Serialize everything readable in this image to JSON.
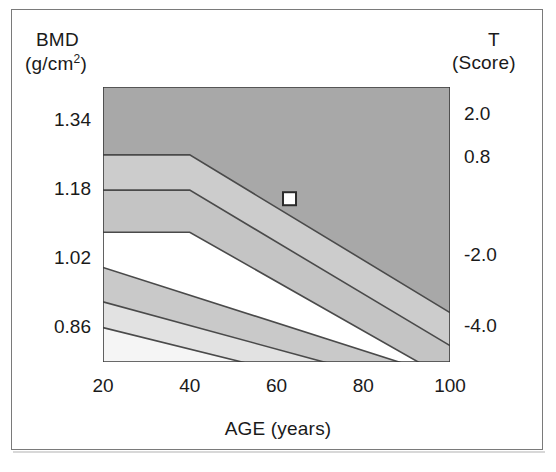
{
  "figure": {
    "type": "medical-chart",
    "background_color": "#ffffff",
    "frame_color": "#7a7a7a"
  },
  "axes": {
    "left_title_line1": "BMD",
    "left_title_line2_prefix": "(g/cm",
    "left_title_line2_sup": "2",
    "left_title_line2_suffix": ")",
    "right_title_line1": "T",
    "right_title_line2": "(Score)",
    "x_title": "AGE (years)"
  },
  "chart_data": {
    "type": "area",
    "title": "",
    "subtitle": "",
    "xlabel": "AGE (years)",
    "ylabel": "BMD (g/cm2)",
    "y2label": "T (Score)",
    "xlim": [
      20,
      100
    ],
    "ylim": [
      0.78,
      1.42
    ],
    "y2lim": [
      -5.0,
      2.8
    ],
    "grid": false,
    "legend": false,
    "x_ticks_major": [
      20,
      40,
      60,
      80,
      100
    ],
    "x_ticks_major_labels": [
      "20",
      "40",
      "60",
      "80",
      "100"
    ],
    "x_ticks_minor": [
      30,
      50,
      70,
      90
    ],
    "y_ticks_major": [
      1.34,
      1.18,
      1.02,
      0.86
    ],
    "y_ticks_major_labels": [
      "1.34",
      "1.18",
      "1.02",
      "0.86"
    ],
    "y_ticks_minor": [
      1.26,
      1.1,
      0.94
    ],
    "y2_ticks_major": [
      2.0,
      0.8,
      -2.0,
      -4.0
    ],
    "y2_ticks_major_labels": [
      "2.0",
      "0.8",
      "-2.0",
      "-4.0"
    ],
    "y2_ticks_minor": [
      1.4,
      -0.4,
      -1.0,
      -3.0
    ],
    "bands": [
      {
        "name": "normal-zone",
        "fill": "#a8a8a8",
        "description": "Upper dark gray region: normal bone mineral density",
        "upper_x": [
          20,
          100
        ],
        "upper_y": [
          1.42,
          1.42
        ],
        "lower_x": [
          20,
          40,
          100
        ],
        "lower_y": [
          1.262,
          1.262,
          0.895
        ]
      },
      {
        "name": "mean-upper-band",
        "fill": "#cccccc",
        "description": "Band between +1SD line and mean line",
        "upper_x": [
          20,
          40,
          100
        ],
        "upper_y": [
          1.262,
          1.262,
          0.895
        ],
        "lower_x": [
          20,
          40,
          100
        ],
        "lower_y": [
          1.18,
          1.18,
          0.818
        ]
      },
      {
        "name": "mean-lower-band",
        "fill": "#c4c4c4",
        "description": "Band between mean line and -1SD line",
        "upper_x": [
          20,
          40,
          100
        ],
        "upper_y": [
          1.18,
          1.18,
          0.818
        ],
        "lower_x": [
          20,
          40,
          100
        ],
        "lower_y": [
          1.082,
          1.082,
          0.738
        ]
      },
      {
        "name": "osteopenia-zone",
        "fill": "#c9c9c9",
        "description": "Lower-left shaded region, osteopenia",
        "upper_x": [
          20,
          100
        ],
        "upper_y": [
          1.0,
          0.742
        ],
        "lower_x": [
          20,
          100
        ],
        "lower_y": [
          0.92,
          0.7
        ]
      },
      {
        "name": "osteoporosis-zone",
        "fill": "#e2e2e2",
        "description": "Lowest shaded region, osteoporosis",
        "upper_x": [
          20,
          100
        ],
        "upper_y": [
          0.92,
          0.7
        ],
        "lower_x": [
          20,
          100
        ],
        "lower_y": [
          0.86,
          0.66
        ]
      },
      {
        "name": "below-zone",
        "fill": "#f5f5f5",
        "description": "Region below osteoporosis threshold",
        "upper_x": [
          20,
          100
        ],
        "upper_y": [
          0.86,
          0.66
        ],
        "lower_x": [
          20,
          100
        ],
        "lower_y": [
          0.78,
          0.78
        ]
      }
    ],
    "reference_lines": [
      {
        "name": "plus-1sd-line",
        "x": [
          20,
          40,
          100
        ],
        "y": [
          1.262,
          1.262,
          0.895
        ],
        "color": "#4a4a4a"
      },
      {
        "name": "mean-line",
        "x": [
          20,
          40,
          100
        ],
        "y": [
          1.18,
          1.18,
          0.818
        ],
        "color": "#4a4a4a"
      },
      {
        "name": "minus-1sd-line",
        "x": [
          20,
          40,
          100
        ],
        "y": [
          1.082,
          1.082,
          0.738
        ],
        "color": "#4a4a4a"
      },
      {
        "name": "upper-flat-line",
        "x": [
          20,
          100
        ],
        "y": [
          1.0,
          0.742
        ],
        "color": "#4a4a4a"
      },
      {
        "name": "mid-flat-line",
        "x": [
          20,
          100
        ],
        "y": [
          0.92,
          0.7
        ],
        "color": "#4a4a4a"
      },
      {
        "name": "lower-flat-line",
        "x": [
          20,
          100
        ],
        "y": [
          0.86,
          0.66
        ],
        "color": "#4a4a4a"
      }
    ],
    "series": [
      {
        "name": "patient-measurement",
        "marker": "square",
        "marker_fill": "#ffffff",
        "marker_edge": "#2b2b2b",
        "x": [
          63
        ],
        "y": [
          1.16
        ],
        "t_score": [
          0.7
        ]
      }
    ]
  }
}
